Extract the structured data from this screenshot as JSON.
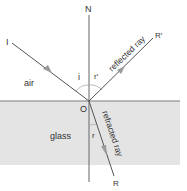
{
  "diagram": {
    "labels": {
      "normal": "N",
      "incident_start": "I",
      "reflected_end": "R′",
      "refracted_end": "R",
      "origin": "O",
      "angle_incidence": "i",
      "angle_reflection": "r′",
      "angle_refraction": "r",
      "medium_top": "air",
      "medium_bottom": "glass",
      "reflected_ray": "reflected ray",
      "refracted_ray": "refracted ray"
    },
    "colors": {
      "glass": "#e4e4e4",
      "surface": "#7a7a7a",
      "line": "#555555",
      "arrow": "#9a9a9a",
      "arc": "#aaaaaa"
    }
  }
}
